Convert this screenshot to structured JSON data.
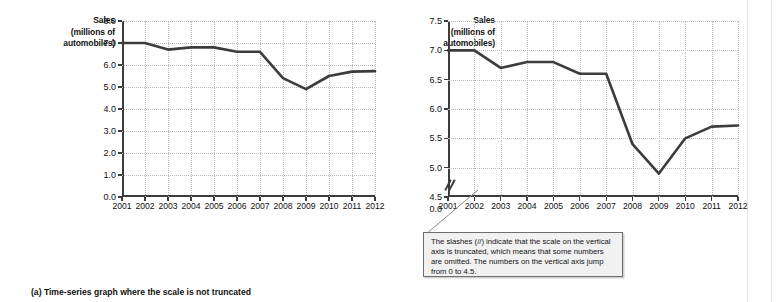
{
  "figure": {
    "panels": [
      {
        "id": "a",
        "caption": "(a) Time-series graph where the scale is not truncated",
        "axis_title_lines": [
          "Sales",
          "(millions of",
          "automobiles)"
        ]
      },
      {
        "id": "b",
        "caption": "(b) Time-series graph with truncated scale",
        "axis_title_lines": [
          "Sales",
          "(millions of",
          "automobiles)"
        ]
      }
    ],
    "callout": {
      "text": "The slashes (//) indicate that the scale on the vertical axis is truncated, which means that some numbers are omitted.  The numbers on the vertical axis jump from 0 to 4.5."
    },
    "colors": {
      "line": "#3c3c3c",
      "grid": "#b9b9b9",
      "axis": "#3c3c3c",
      "callout_bg": "#f1f1f1",
      "callout_border": "#6e6e6e"
    }
  },
  "chart_data": [
    {
      "type": "line",
      "title": "(a) Time-series graph where the scale is not truncated",
      "xlabel": "",
      "ylabel": "Sales (millions of automobiles)",
      "categories": [
        "2001",
        "2002",
        "2003",
        "2004",
        "2005",
        "2006",
        "2007",
        "2008",
        "2009",
        "2010",
        "2011",
        "2012"
      ],
      "x": [
        2001,
        2002,
        2003,
        2004,
        2005,
        2006,
        2007,
        2008,
        2009,
        2010,
        2011,
        2012
      ],
      "values": [
        7.0,
        7.0,
        6.7,
        6.8,
        6.8,
        6.6,
        6.6,
        5.4,
        4.9,
        5.5,
        5.7,
        5.72
      ],
      "ylim": [
        0.0,
        8.0
      ],
      "yticks": [
        0.0,
        1.0,
        2.0,
        3.0,
        4.0,
        5.0,
        6.0,
        7.0,
        8.0
      ],
      "ytick_labels": [
        "0.0",
        "1.0",
        "2.0",
        "3.0",
        "4.0",
        "5.0",
        "6.0",
        "7.0",
        "8.0"
      ],
      "grid": true,
      "legend": "none",
      "truncated_axis": false
    },
    {
      "type": "line",
      "title": "(b) Time-series graph with truncated scale",
      "xlabel": "",
      "ylabel": "Sales (millions of automobiles)",
      "categories": [
        "2001",
        "2002",
        "2003",
        "2004",
        "2005",
        "2006",
        "2007",
        "2008",
        "2009",
        "2010",
        "2011",
        "2012"
      ],
      "x": [
        2001,
        2002,
        2003,
        2004,
        2005,
        2006,
        2007,
        2008,
        2009,
        2010,
        2011,
        2012
      ],
      "values": [
        7.0,
        7.0,
        6.7,
        6.8,
        6.8,
        6.6,
        6.6,
        5.4,
        4.9,
        5.5,
        5.7,
        5.72
      ],
      "ylim": [
        4.5,
        7.5
      ],
      "yticks": [
        4.5,
        5.0,
        5.5,
        6.0,
        6.5,
        7.0,
        7.5
      ],
      "ytick_labels": [
        "4.5",
        "5.0",
        "5.5",
        "6.0",
        "6.5",
        "7.0",
        "7.5"
      ],
      "extra_ytick_label": "0.0",
      "grid": true,
      "legend": "none",
      "truncated_axis": true,
      "truncation_note": "The numbers on the vertical axis jump from 0 to 4.5."
    }
  ]
}
